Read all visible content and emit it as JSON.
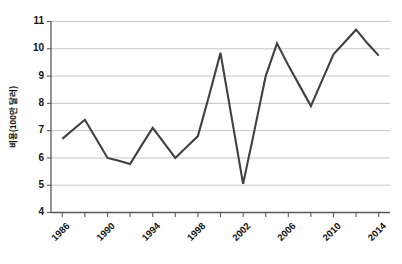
{
  "chart_data": {
    "type": "line",
    "title": "",
    "xlabel": "",
    "ylabel": "비용(100만 달러)",
    "x": [
      1986,
      1987,
      1988,
      1989,
      1990,
      1991,
      1992,
      1993,
      1994,
      1995,
      1996,
      1997,
      1998,
      1999,
      2000,
      2001,
      2002,
      2003,
      2004,
      2005,
      2006,
      2007,
      2008,
      2009,
      2010,
      2011,
      2012,
      2013,
      2014
    ],
    "values": [
      6.7,
      7.05,
      7.4,
      6.7,
      6.0,
      5.9,
      5.78,
      6.45,
      7.1,
      6.55,
      6.0,
      6.4,
      6.8,
      8.3,
      9.85,
      7.45,
      5.05,
      7.0,
      9.0,
      10.2,
      9.4,
      8.65,
      7.9,
      8.85,
      9.8,
      10.25,
      10.7,
      10.2,
      9.75
    ],
    "series": [
      {
        "name": "비용",
        "color": "#404040",
        "values": [
          6.7,
          7.05,
          7.4,
          6.7,
          6.0,
          5.9,
          5.78,
          6.45,
          7.1,
          6.55,
          6.0,
          6.4,
          6.8,
          8.3,
          9.85,
          7.45,
          5.05,
          7.0,
          9.0,
          10.2,
          9.4,
          8.65,
          7.9,
          8.85,
          9.8,
          10.25,
          10.7,
          10.2,
          9.75
        ]
      }
    ],
    "xlim": [
      1985,
      2015
    ],
    "ylim": [
      4,
      11
    ],
    "ytick_labels": [
      "4",
      "5",
      "6",
      "7",
      "8",
      "9",
      "10",
      "11"
    ],
    "ytick_values": [
      4,
      5,
      6,
      7,
      8,
      9,
      10,
      11
    ],
    "xtick_label_values": [
      1986,
      1990,
      1994,
      1998,
      2002,
      2006,
      2010,
      2014
    ],
    "xtick_labels": [
      "1986",
      "1990",
      "1994",
      "1998",
      "2002",
      "2006",
      "2010",
      "2014"
    ],
    "xtick_minor_values": [
      1986,
      1988,
      1990,
      1992,
      1994,
      1996,
      1998,
      2000,
      2002,
      2004,
      2006,
      2008,
      2010,
      2012,
      2014
    ],
    "grid": true,
    "grid_axis": "y",
    "legend": false,
    "legend_position": "none",
    "line_color": "#404040",
    "grid_color": "#b6b6b6",
    "axis_color": "#5a5a5a",
    "background": "#ffffff"
  }
}
